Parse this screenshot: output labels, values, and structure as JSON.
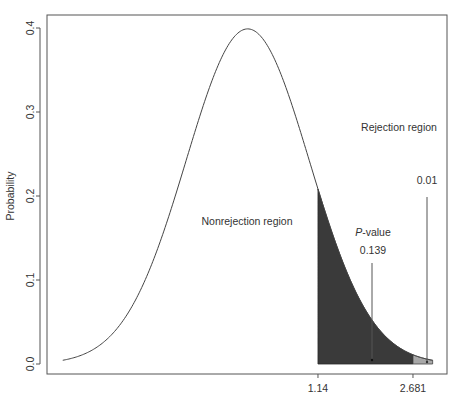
{
  "chart_data": {
    "type": "area",
    "title": "",
    "xlabel": "",
    "ylabel": "Probability",
    "ylim": [
      0.0,
      0.4
    ],
    "xlim": [
      -3.0,
      3.0
    ],
    "yticks": [
      "0.0",
      "0.1",
      "0.2",
      "0.3",
      "0.4"
    ],
    "ytick_values": [
      0.0,
      0.1,
      0.2,
      0.3,
      0.4
    ],
    "xticks": [
      "1.14",
      "2.681"
    ],
    "xtick_values": [
      1.14,
      2.681
    ],
    "grid": false,
    "legend": null,
    "series": [
      {
        "name": "Standard normal density",
        "distribution": "normal",
        "mean": 0,
        "sd": 1,
        "x_range": [
          -3.0,
          3.0
        ]
      }
    ],
    "shaded_regions": [
      {
        "name": "P-value area",
        "from": 1.14,
        "to": 2.681,
        "color": "#3a3a3a",
        "value": 0.139
      },
      {
        "name": "Rejection region area",
        "from": 2.681,
        "to": 3.0,
        "color": "#a8a8a8",
        "value": 0.01
      }
    ],
    "annotations": [
      {
        "text": "Nonrejection region"
      },
      {
        "text": "Rejection region"
      },
      {
        "text": "0.01"
      },
      {
        "text_italic": "P",
        "text": "-value"
      },
      {
        "text": "0.139"
      }
    ]
  },
  "labels": {
    "ylabel": "Probability",
    "yticks": [
      "0.0",
      "0.1",
      "0.2",
      "0.3",
      "0.4"
    ],
    "xticks": [
      "1.14",
      "2.681"
    ],
    "nonrejection": "Nonrejection region",
    "rejection": "Rejection region",
    "alpha": "0.01",
    "pvalue_italic": "P",
    "pvalue_rest": "-value",
    "pvalue_number": "0.139"
  }
}
